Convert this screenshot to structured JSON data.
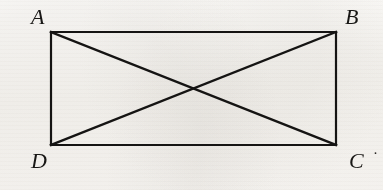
{
  "figure": {
    "background_color": "#fbfaf8",
    "stroke_color": "#151413",
    "label_color": "#181715",
    "stroke_width": 2.2,
    "canvas": {
      "width": 383,
      "height": 190
    },
    "rectangle": {
      "x": 51,
      "y": 32,
      "width": 285,
      "height": 113,
      "corners": {
        "top_left": [
          51,
          32
        ],
        "top_right": [
          336,
          32
        ],
        "bottom_right": [
          336,
          145
        ],
        "bottom_left": [
          51,
          145
        ]
      }
    },
    "diagonals": [
      {
        "name": "diagonal-A-C",
        "from": [
          51,
          32
        ],
        "to": [
          336,
          145
        ]
      },
      {
        "name": "diagonal-B-D",
        "from": [
          336,
          32
        ],
        "to": [
          51,
          145
        ]
      }
    ],
    "intersection": [
      193,
      88
    ],
    "vertex_labels": [
      {
        "id": "A",
        "text": "A",
        "position": "top-left",
        "x": 31,
        "y": 6
      },
      {
        "id": "B",
        "text": "B",
        "position": "top-right",
        "x": 345,
        "y": 6
      },
      {
        "id": "C",
        "text": "C",
        "position": "bottom-right",
        "x": 349,
        "y": 150
      },
      {
        "id": "D",
        "text": "D",
        "position": "bottom-left",
        "x": 31,
        "y": 150
      }
    ],
    "stray_mark": {
      "text": "·",
      "x": 373,
      "y": 146
    }
  }
}
